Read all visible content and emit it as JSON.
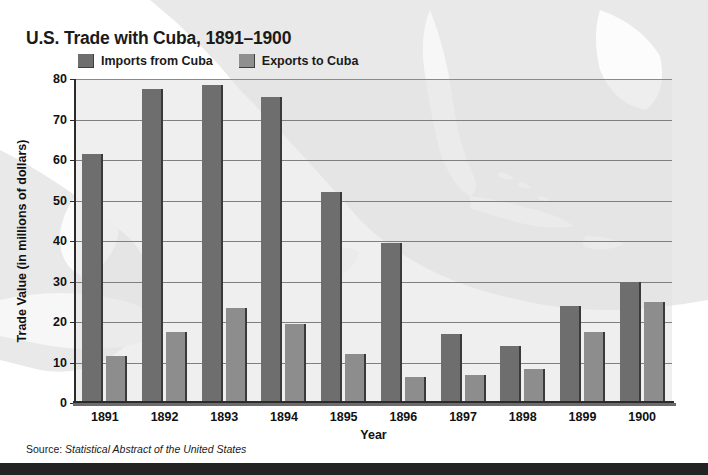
{
  "chart_data": {
    "type": "bar",
    "title": "U.S. Trade with Cuba, 1891–1900",
    "xlabel": "Year",
    "ylabel": "Trade Value (in millions of dollars)",
    "categories": [
      "1891",
      "1892",
      "1893",
      "1894",
      "1895",
      "1896",
      "1897",
      "1898",
      "1899",
      "1900"
    ],
    "series": [
      {
        "name": "Imports from Cuba",
        "color": "#6e6e6e",
        "values": [
          61.5,
          77.5,
          78.5,
          75.5,
          52.0,
          39.5,
          17.0,
          14.0,
          24.0,
          30.0
        ]
      },
      {
        "name": "Exports to Cuba",
        "color": "#8d8d8d",
        "values": [
          11.5,
          17.5,
          23.5,
          19.5,
          12.0,
          6.5,
          7.0,
          8.5,
          17.5,
          25.0
        ]
      }
    ],
    "ylim": [
      0,
      80
    ],
    "yticks": [
      0,
      10,
      20,
      30,
      40,
      50,
      60,
      70,
      80
    ],
    "grid": true,
    "legend_position": "top",
    "source_label": "Source:",
    "source_title": "Statistical Abstract of the United States"
  },
  "colors": {
    "imports": "#6e6e6e",
    "exports": "#8d8d8d",
    "plot_background": "#e2e2e2",
    "gridline": "#7f7f7f",
    "axis": "#2b2b2b",
    "text": "#111111",
    "bottom_bar": "#232323"
  }
}
